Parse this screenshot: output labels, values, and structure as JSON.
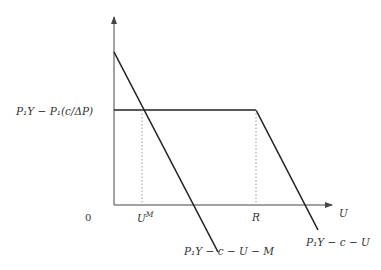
{
  "diagram": {
    "y_label": "P₁Y − P₁(c/ΔP)",
    "x_axis_label": "U",
    "origin_label": "0",
    "x_ticks": [
      {
        "label": "U",
        "sup": "M",
        "x": 142
      },
      {
        "label": "R",
        "x": 256
      }
    ],
    "line_labels": {
      "steep": "P₁Y − c − U − M",
      "shallow": "P₁Y − c − U"
    },
    "colors": {
      "axis": "#444444",
      "line": "#222222",
      "dotted": "#999999"
    }
  }
}
